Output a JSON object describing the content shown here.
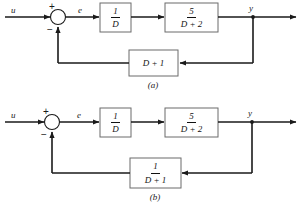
{
  "figure": {
    "type": "control-block-diagram",
    "background_color": "#ffffff",
    "line_color": "#1a1a1a",
    "block_border_color": "#6b6b6b"
  },
  "diagram_a": {
    "caption": "(a)",
    "input_label": "u",
    "error_label": "e",
    "output_label": "y",
    "sum_plus": "+",
    "sum_minus": "−",
    "blocks": [
      {
        "name": "integrator",
        "numerator": "1",
        "denominator": "D",
        "kind": "fraction"
      },
      {
        "name": "plant",
        "numerator": "5",
        "denominator": "D + 2",
        "kind": "fraction"
      },
      {
        "name": "feedback",
        "expression": "D + 1",
        "kind": "plain"
      }
    ]
  },
  "diagram_b": {
    "caption": "(b)",
    "input_label": "u",
    "error_label": "e",
    "output_label": "y",
    "sum_plus": "+",
    "sum_minus": "−",
    "blocks": [
      {
        "name": "integrator",
        "numerator": "1",
        "denominator": "D",
        "kind": "fraction"
      },
      {
        "name": "plant",
        "numerator": "5",
        "denominator": "D + 2",
        "kind": "fraction"
      },
      {
        "name": "feedback",
        "numerator": "1",
        "denominator": "D + 1",
        "kind": "fraction"
      }
    ]
  }
}
